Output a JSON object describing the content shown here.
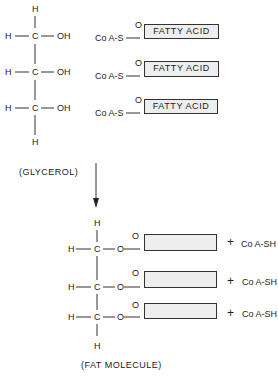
{
  "glycerol": {
    "atoms": {
      "h": "H",
      "c": "C",
      "oh": "OH"
    },
    "label": "(GLYCEROL)"
  },
  "coa_thioesters": [
    {
      "coa": "Co A-S",
      "o": "O",
      "box": "FATTY ACID"
    },
    {
      "coa": "Co A-S",
      "o": "O",
      "box": "FATTY ACID"
    },
    {
      "coa": "Co A-S",
      "o": "O",
      "box": "FATTY ACID"
    }
  ],
  "fat_molecule": {
    "atoms": {
      "h": "H",
      "c": "C",
      "o": "O"
    },
    "label": "(FAT MOLECULE)"
  },
  "products": [
    {
      "plus": "+",
      "text": "Co A-SH"
    },
    {
      "plus": "+",
      "text": "Co A-SH"
    },
    {
      "plus": "+",
      "text": "Co A-SH"
    }
  ]
}
